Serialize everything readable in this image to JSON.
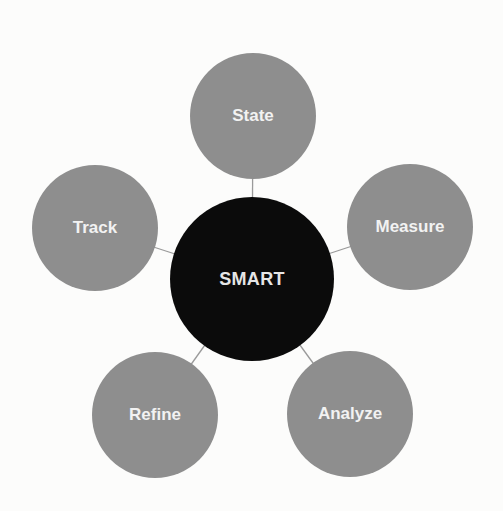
{
  "diagram": {
    "type": "hub-and-spoke",
    "colors": {
      "background": "#fcfcfb",
      "center_fill": "#0b0b0b",
      "satellite_fill": "#8e8e8e",
      "label": "#f2f2f2",
      "connector": "#9a9a9a"
    },
    "center": {
      "label": "SMART",
      "cx": 252,
      "cy": 279,
      "r": 82
    },
    "satellites": [
      {
        "id": "state",
        "label": "State",
        "cx": 253,
        "cy": 116,
        "r": 63
      },
      {
        "id": "measure",
        "label": "Measure",
        "cx": 410,
        "cy": 227,
        "r": 63
      },
      {
        "id": "analyze",
        "label": "Analyze",
        "cx": 350,
        "cy": 414,
        "r": 63
      },
      {
        "id": "refine",
        "label": "Refine",
        "cx": 155,
        "cy": 415,
        "r": 63
      },
      {
        "id": "track",
        "label": "Track",
        "cx": 95,
        "cy": 228,
        "r": 63
      }
    ]
  }
}
